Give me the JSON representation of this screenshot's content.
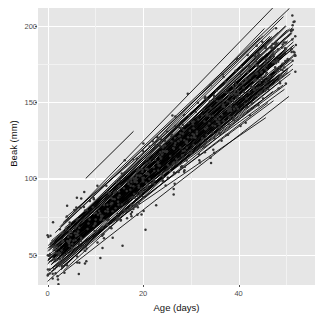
{
  "chart_data": {
    "type": "scatter",
    "title": "",
    "subtitle": "",
    "xlabel": "Age (days)",
    "ylabel": "Beak (mm)",
    "xlim": [
      -2,
      56
    ],
    "ylim": [
      30,
      212
    ],
    "xticks": [
      0,
      20,
      40
    ],
    "xtick_labels": [
      "0",
      "20",
      "40"
    ],
    "yticks": [
      50,
      100,
      150,
      200
    ],
    "ytick_labels": [
      "50",
      "100",
      "150",
      "200"
    ],
    "grid": true,
    "grid_major_color": "#ffffff",
    "grid_minor_color": "#f2f2f2",
    "panel_background": "#e6e6e6",
    "legend": "none",
    "point_color": "#333333",
    "line_color": "#000000",
    "series": [
      {
        "name": "observations",
        "type": "scatter",
        "n_points": 640,
        "x_range": [
          0,
          52
        ],
        "y_range": [
          38,
          195
        ],
        "trend_intercept": 45,
        "trend_slope": 2.75,
        "residual_sd": 11
      },
      {
        "name": "subject fits",
        "type": "line",
        "n_lines": 120,
        "intercept_mean": 46,
        "intercept_sd": 7,
        "slope_mean": 2.75,
        "slope_sd": 0.22,
        "x_start_range": [
          0,
          4
        ],
        "x_end_range": [
          44,
          52
        ]
      },
      {
        "name": "outlier fit",
        "type": "line",
        "x": [
          8,
          18
        ],
        "y": [
          100,
          131
        ]
      }
    ]
  }
}
